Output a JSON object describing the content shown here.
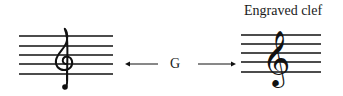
{
  "diagram": {
    "caption": "Engraved clef",
    "center_label": "G",
    "colors": {
      "ink": "#111111",
      "background": "#ffffff"
    },
    "left_staff": {
      "description": "handwritten treble clef",
      "clef": "treble-clef-handwritten",
      "x1": 19,
      "x2": 113,
      "lines_y": [
        36,
        46,
        55,
        64,
        74
      ]
    },
    "right_staff": {
      "description": "engraved treble clef",
      "clef": "treble-clef-engraved",
      "x1": 241,
      "x2": 321,
      "lines_y": [
        35,
        44,
        53,
        62,
        72
      ]
    },
    "arrows": [
      {
        "direction": "left",
        "x1": 158,
        "x2": 125,
        "y": 64
      },
      {
        "direction": "right",
        "x1": 198,
        "x2": 236,
        "y": 64
      }
    ]
  }
}
